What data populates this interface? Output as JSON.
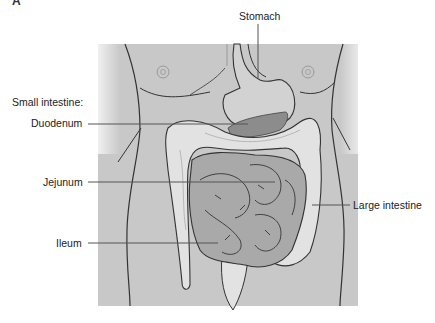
{
  "figure": {
    "panel_letter": "A",
    "labels": {
      "stomach": "Stomach",
      "small_intestine_heading": "Small intestine:",
      "duodenum": "Duodenum",
      "jejunum": "Jejunum",
      "ileum": "Ileum",
      "large_intestine": "Large intestine"
    },
    "colors": {
      "body_fill": "#c8c8c8",
      "large_intestine_fill": "#e2e2e2",
      "small_intestine_fill": "#a9a9a9",
      "liver_pancreas_fill": "#8c8c8c",
      "outline": "#333333",
      "leader_line": "#555555"
    }
  }
}
